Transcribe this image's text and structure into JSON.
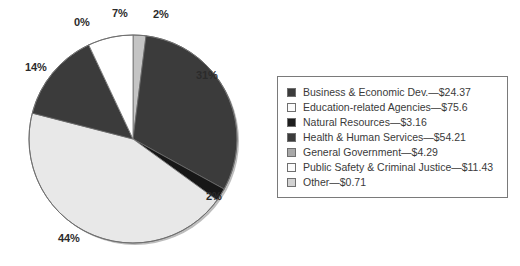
{
  "chart_data": {
    "type": "pie",
    "title": "",
    "subtitle": "",
    "xlabel": "",
    "ylabel": "",
    "grid": false,
    "legend_position": "right",
    "value_unit": "billions of dollars",
    "categories": [
      "Business & Economic Dev.",
      "Education-related Agencies",
      "Natural Resources",
      "Health & Human Services",
      "General Government",
      "Public Safety & Criminal Justice",
      "Other"
    ],
    "values": [
      24.37,
      75.6,
      3.16,
      54.21,
      4.29,
      11.43,
      0.71
    ],
    "percentages": [
      31,
      44,
      2,
      14,
      0,
      7,
      2
    ],
    "colors": [
      "#3b3b3b",
      "#e8e8e8",
      "#171717",
      "#3b3b3b",
      "#9a9a9a",
      "#ffffff",
      "#c4c4c4"
    ],
    "slices": [
      {
        "name": "Other",
        "amount": "$0.71",
        "percent_label": "2%",
        "percent": 2,
        "value": 0.71,
        "color": "#c4c4c4"
      },
      {
        "name": "Business & Economic Dev.",
        "amount": "$24.37",
        "percent_label": "31%",
        "percent": 31,
        "value": 24.37,
        "color": "#3b3b3b"
      },
      {
        "name": "Natural Resources",
        "amount": "$3.16",
        "percent_label": "2%",
        "percent": 2,
        "value": 3.16,
        "color": "#171717"
      },
      {
        "name": "Education-related Agencies",
        "amount": "$75.6",
        "percent_label": "44%",
        "percent": 44,
        "value": 75.6,
        "color": "#e8e8e8"
      },
      {
        "name": "Health & Human Services",
        "amount": "$54.21",
        "percent_label": "14%",
        "percent": 14,
        "value": 54.21,
        "color": "#3b3b3b"
      },
      {
        "name": "General Government",
        "amount": "$4.29",
        "percent_label": "0%",
        "percent": 0,
        "value": 4.29,
        "color": "#9a9a9a"
      },
      {
        "name": "Public Safety & Criminal Justice",
        "amount": "$11.43",
        "percent_label": "7%",
        "percent": 7,
        "value": 11.43,
        "color": "#ffffff"
      }
    ]
  },
  "pie_labels": {
    "other_top": "2%",
    "business": "31%",
    "natural_resources": "2%",
    "education": "44%",
    "health": "14%",
    "general_government": "0%",
    "public_safety": "7%"
  },
  "legend": {
    "items": [
      {
        "label": "Business & Economic Dev.—$24.37",
        "swatch": "#3b3b3b"
      },
      {
        "label": "Education-related Agencies—$75.6",
        "swatch": "#fbfbfb"
      },
      {
        "label": "Natural Resources—$3.16",
        "swatch": "#1d1d1d"
      },
      {
        "label": "Health & Human Services—$54.21",
        "swatch": "#3b3b3b"
      },
      {
        "label": "General Government—$4.29",
        "swatch": "#a8a8a8"
      },
      {
        "label": "Public Safety & Criminal Justice—$11.43",
        "swatch": "#fbfbfb"
      },
      {
        "label": "Other—$0.71",
        "swatch": "#d2d2d2"
      }
    ]
  }
}
